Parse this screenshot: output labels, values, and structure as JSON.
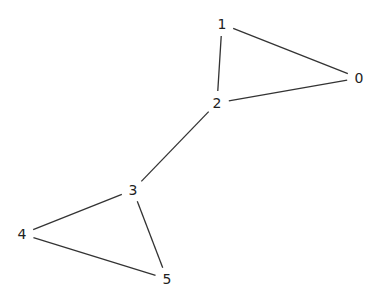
{
  "graph": {
    "style": {
      "edge_color": "#333333",
      "label_color": "#222222",
      "background": "#ffffff"
    },
    "nodes": [
      {
        "id": "0",
        "label": "0",
        "x": 359,
        "y": 78
      },
      {
        "id": "1",
        "label": "1",
        "x": 222,
        "y": 24
      },
      {
        "id": "2",
        "label": "2",
        "x": 217,
        "y": 103
      },
      {
        "id": "3",
        "label": "3",
        "x": 133,
        "y": 190
      },
      {
        "id": "4",
        "label": "4",
        "x": 22,
        "y": 234
      },
      {
        "id": "5",
        "label": "5",
        "x": 167,
        "y": 279
      }
    ],
    "edges": [
      {
        "source": "0",
        "target": "1"
      },
      {
        "source": "0",
        "target": "2"
      },
      {
        "source": "1",
        "target": "2"
      },
      {
        "source": "2",
        "target": "3"
      },
      {
        "source": "3",
        "target": "4"
      },
      {
        "source": "3",
        "target": "5"
      },
      {
        "source": "4",
        "target": "5"
      }
    ]
  }
}
